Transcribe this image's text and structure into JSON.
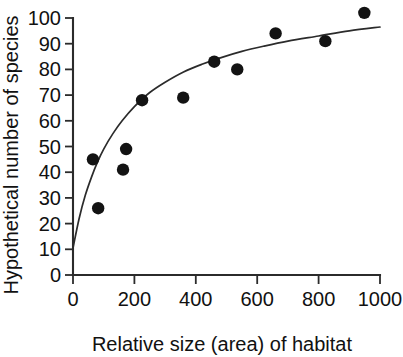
{
  "chart_data": {
    "type": "scatter",
    "title": "",
    "xlabel": "Relative size (area) of habitat",
    "ylabel": "Hypothetical number of species",
    "xlim": [
      0,
      1000
    ],
    "ylim": [
      0,
      100
    ],
    "xticks": [
      0,
      200,
      400,
      600,
      800,
      1000
    ],
    "yticks": [
      0,
      10,
      20,
      30,
      40,
      50,
      60,
      70,
      80,
      90,
      100
    ],
    "xtick_labels": [
      "0",
      "200",
      "400",
      "600",
      "800",
      "1000"
    ],
    "ytick_labels": [
      "0",
      "10",
      "20",
      "30",
      "40",
      "50",
      "60",
      "70",
      "80",
      "90",
      "100"
    ],
    "grid": false,
    "legend": false,
    "marker": "filled-circle",
    "marker_color": "#131313",
    "curve_color": "#2b2b2b",
    "points": [
      {
        "x": 65,
        "y": 45
      },
      {
        "x": 82,
        "y": 26
      },
      {
        "x": 163,
        "y": 41
      },
      {
        "x": 173,
        "y": 49
      },
      {
        "x": 225,
        "y": 68
      },
      {
        "x": 359,
        "y": 69
      },
      {
        "x": 460,
        "y": 83
      },
      {
        "x": 535,
        "y": 80
      },
      {
        "x": 660,
        "y": 94
      },
      {
        "x": 822,
        "y": 91
      },
      {
        "x": 949,
        "y": 102
      }
    ],
    "fit_curve": {
      "description": "saturating species-area curve rising steeply from near 10 at x=0 toward an asymptote near 97",
      "points": [
        {
          "x": 0,
          "y": 10.5
        },
        {
          "x": 20,
          "y": 22
        },
        {
          "x": 40,
          "y": 31
        },
        {
          "x": 60,
          "y": 38
        },
        {
          "x": 80,
          "y": 44
        },
        {
          "x": 100,
          "y": 49
        },
        {
          "x": 130,
          "y": 55
        },
        {
          "x": 160,
          "y": 60
        },
        {
          "x": 200,
          "y": 65.5
        },
        {
          "x": 250,
          "y": 71
        },
        {
          "x": 300,
          "y": 75
        },
        {
          "x": 360,
          "y": 79
        },
        {
          "x": 420,
          "y": 82
        },
        {
          "x": 480,
          "y": 84.5
        },
        {
          "x": 550,
          "y": 87
        },
        {
          "x": 620,
          "y": 89
        },
        {
          "x": 700,
          "y": 91
        },
        {
          "x": 800,
          "y": 93
        },
        {
          "x": 900,
          "y": 95
        },
        {
          "x": 1000,
          "y": 96.5
        }
      ]
    }
  }
}
